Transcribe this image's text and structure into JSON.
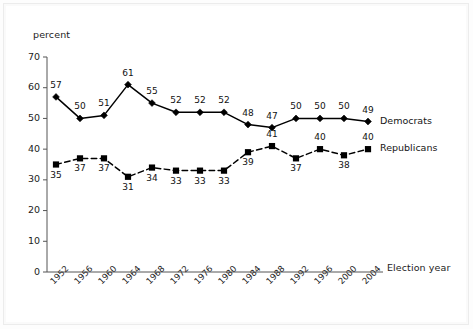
{
  "chart_data": {
    "type": "line",
    "title": "",
    "subtitle": "",
    "xlabel": "Election year",
    "ylabel": "percent",
    "x": [
      1952,
      1956,
      1960,
      1964,
      1968,
      1972,
      1976,
      1980,
      1984,
      1988,
      1992,
      1996,
      2000,
      2004
    ],
    "categories": [
      "1952",
      "1956",
      "1960",
      "1964",
      "1968",
      "1972",
      "1976",
      "1980",
      "1984",
      "1988",
      "1992",
      "1996",
      "2000",
      "2004"
    ],
    "ylim": [
      0,
      70
    ],
    "yticks": [
      0,
      10,
      20,
      30,
      40,
      50,
      60,
      70
    ],
    "yticklabels": [
      "0",
      "10",
      "20",
      "30",
      "40",
      "50",
      "60",
      "70"
    ],
    "grid": false,
    "legend_position": "right-inline",
    "series": [
      {
        "name": "Democrats",
        "marker": "diamond",
        "linestyle": "solid",
        "color": "#000000",
        "values": [
          57,
          50,
          51,
          61,
          55,
          52,
          52,
          52,
          48,
          47,
          50,
          50,
          50,
          49
        ],
        "label_positions": [
          "above",
          "above",
          "above",
          "above",
          "above",
          "above",
          "above",
          "above",
          "above",
          "above",
          "above",
          "above",
          "above",
          "above"
        ]
      },
      {
        "name": "Republicans",
        "marker": "square",
        "linestyle": "dashed",
        "color": "#000000",
        "values": [
          35,
          37,
          37,
          31,
          34,
          33,
          33,
          33,
          39,
          41,
          37,
          40,
          38,
          40
        ],
        "label_positions": [
          "below",
          "below",
          "below",
          "below",
          "below",
          "below",
          "below",
          "below",
          "below",
          "above",
          "below",
          "above",
          "below",
          "above"
        ]
      }
    ]
  },
  "axes": {
    "y_axis_title": "percent",
    "x_axis_title": "Election year"
  },
  "legend": {
    "democrats": "Democrats",
    "republicans": "Republicans"
  }
}
